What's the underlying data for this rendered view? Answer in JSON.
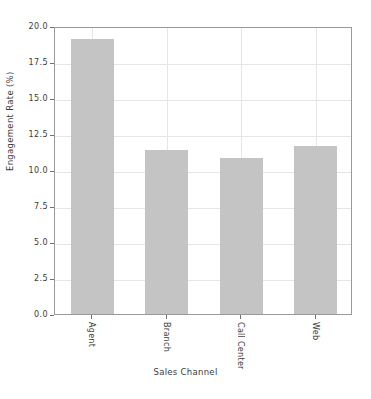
{
  "chart_data": {
    "type": "bar",
    "title": "",
    "xlabel": "Sales Channel",
    "ylabel": "Engagement Rate (%)",
    "categories": [
      "Agent",
      "Branch",
      "Call Center",
      "Web"
    ],
    "values": [
      19.1,
      11.4,
      10.8,
      11.65
    ],
    "ylim": [
      0.0,
      20.0
    ],
    "yticks": [
      "0.0",
      "2.5",
      "5.0",
      "7.5",
      "10.0",
      "12.5",
      "15.0",
      "17.5",
      "20.0"
    ],
    "ytick_values": [
      0.0,
      2.5,
      5.0,
      7.5,
      10.0,
      12.5,
      15.0,
      17.5,
      20.0
    ],
    "grid": true,
    "legend": "none",
    "bar_color": "#c4c4c4",
    "grid_color": "#e6e6e6",
    "axis_color": "#9a9a9a",
    "background_color": "#ffffff"
  }
}
